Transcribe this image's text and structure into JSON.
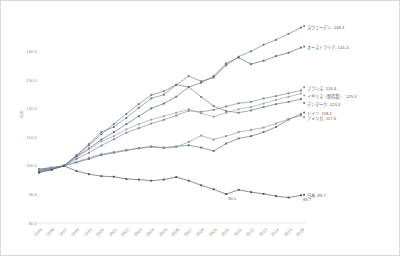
{
  "chart_data": {
    "type": "line",
    "title": "",
    "xlabel": "",
    "ylabel": "指数",
    "ylim": [
      80.0,
      150.0
    ],
    "ytick_values": [
      80.0,
      90.0,
      100.0,
      110.0,
      120.0,
      130.0,
      140.0
    ],
    "ytick_labels": [
      "80.0",
      "90.0",
      "100.0",
      "110.0",
      "120.0",
      "130.0",
      "140.0"
    ],
    "grid": false,
    "legend_position": "right-inline-endpoint-labels",
    "x": [
      "1995",
      "1996",
      "1997",
      "1998",
      "1999",
      "2000",
      "2001",
      "2002",
      "2003",
      "2004",
      "2005",
      "2006",
      "2007",
      "2008",
      "2009",
      "2010",
      "2011",
      "2012",
      "2013",
      "2014",
      "2015",
      "2016"
    ],
    "categories": [
      "1995",
      "1996",
      "1997",
      "1998",
      "1999",
      "2000",
      "2001",
      "2002",
      "2003",
      "2004",
      "2005",
      "2006",
      "2007",
      "2008",
      "2009",
      "2010",
      "2011",
      "2012",
      "2013",
      "2014",
      "2015",
      "2016"
    ],
    "series": [
      {
        "name": "スウェーデン",
        "end_value": 148.4,
        "end_label": "スウェーデン, 148.4",
        "color": "#6b7a8f",
        "values": [
          98.2,
          99.1,
          100.0,
          103.8,
          107.6,
          111.9,
          113.6,
          116.8,
          120.3,
          123.6,
          124.9,
          128.3,
          131.4,
          129.6,
          130.9,
          135.2,
          138.2,
          140.1,
          142.4,
          144.1,
          146.2,
          148.4
        ]
      },
      {
        "name": "オーストラリア",
        "end_value": 141.4,
        "end_label": "オーストラリア, 141.4",
        "color": "#5d6b7d",
        "values": [
          97.9,
          98.8,
          100.0,
          103.2,
          106.1,
          109.2,
          111.8,
          114.6,
          117.4,
          120.1,
          121.8,
          124.2,
          127.6,
          129.1,
          131.4,
          135.8,
          137.9,
          135.6,
          136.8,
          138.4,
          139.6,
          141.4
        ]
      },
      {
        "name": "フランス",
        "end_value": 126.4,
        "end_label": "フランス, 126.4",
        "color": "#7b8798",
        "values": [
          98.4,
          99.2,
          100.0,
          102.4,
          104.6,
          107.1,
          109.3,
          111.6,
          113.2,
          114.8,
          116.1,
          117.6,
          119.3,
          118.9,
          119.6,
          120.8,
          121.9,
          122.4,
          123.6,
          124.4,
          125.4,
          126.4
        ]
      },
      {
        "name": "イギリス（製造業）",
        "end_value": 125.3,
        "end_label": "イギリス（製造業）, 125.3",
        "color": "#9aa3ae",
        "values": [
          98.6,
          99.3,
          100.0,
          102.9,
          105.8,
          108.6,
          110.4,
          112.8,
          114.6,
          116.2,
          117.4,
          118.6,
          119.8,
          118.4,
          117.2,
          118.6,
          119.8,
          120.6,
          121.8,
          123.1,
          124.2,
          125.3
        ]
      },
      {
        "name": "デンマーク",
        "end_value": 123.4,
        "end_label": "デンマーク, 123.4",
        "color": "#6e7a8a",
        "values": [
          98.1,
          99.0,
          100.0,
          103.4,
          107.2,
          111.1,
          114.6,
          118.2,
          121.6,
          124.8,
          126.1,
          128.4,
          127.6,
          124.1,
          120.9,
          119.2,
          118.6,
          119.4,
          120.6,
          121.6,
          122.4,
          123.4
        ]
      },
      {
        "name": "ドイツ",
        "end_value": 118.1,
        "end_label": "ドイツ, 118.1",
        "color": "#5f6a78",
        "values": [
          98.9,
          99.4,
          100.0,
          101.2,
          102.4,
          103.8,
          104.6,
          105.4,
          106.2,
          106.8,
          106.4,
          106.8,
          107.2,
          106.4,
          105.2,
          107.8,
          109.6,
          110.4,
          111.8,
          113.6,
          116.2,
          118.1
        ]
      },
      {
        "name": "アメリカ",
        "end_value": 117.6,
        "end_label": "アメリカ, 117.6",
        "color": "#8b95a2",
        "values": [
          98.7,
          99.3,
          100.0,
          101.4,
          102.8,
          104.1,
          104.8,
          105.6,
          106.1,
          106.6,
          106.2,
          106.6,
          108.4,
          110.6,
          109.2,
          110.4,
          111.8,
          112.6,
          113.4,
          114.8,
          116.4,
          117.6
        ]
      },
      {
        "name": "日本",
        "end_value": 89.7,
        "end_label": "日本, 89.7",
        "color": "#4a525e",
        "values": [
          97.6,
          98.6,
          100.0,
          98.2,
          97.1,
          96.4,
          96.2,
          95.4,
          95.2,
          94.8,
          95.2,
          96.1,
          94.8,
          93.2,
          91.8,
          90.1,
          91.6,
          90.8,
          90.2,
          89.4,
          88.9,
          89.7
        ]
      }
    ],
    "annotations": [
      {
        "text": "90.1",
        "x": "2010",
        "y": 90.1
      },
      {
        "text": "89.7",
        "x": "2016",
        "y": 89.7
      }
    ]
  },
  "axis": {
    "y_title": "指数",
    "y_ticks": [
      "140.0",
      "130.0",
      "120.0",
      "110.0",
      "100.0",
      "90.0",
      "80.0"
    ],
    "x_ticks": [
      "1995",
      "1996",
      "1997",
      "1998",
      "1999",
      "2000",
      "2001",
      "2002",
      "2003",
      "2004",
      "2005",
      "2006",
      "2007",
      "2008",
      "2009",
      "2010",
      "2011",
      "2012",
      "2013",
      "2014",
      "2015",
      "2016"
    ]
  },
  "labels": {
    "sweden": "スウェーデン, 148.4",
    "australia": "オーストラリア, 141.4",
    "france": "フランス, 126.4",
    "uk": "イギリス（製造業）, 125.3",
    "denmark": "デンマーク, 123.4",
    "germany": "ドイツ, 118.1",
    "usa": "アメリカ, 117.6",
    "japan": "日本, 89.7",
    "japan_2010": "90.1",
    "japan_2016": "89.7"
  }
}
